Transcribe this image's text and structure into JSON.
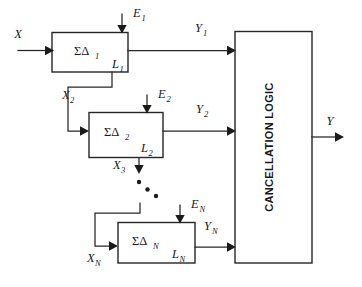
{
  "figure": {
    "type": "block-diagram",
    "background_color": "#ffffff",
    "line_color": "#262626"
  },
  "inputs": {
    "primary": {
      "label": "X",
      "subscript": ""
    }
  },
  "outputs": {
    "final": {
      "label": "Y",
      "subscript": ""
    }
  },
  "stages": [
    {
      "id": "stage-1",
      "block_label": "ΣΔ",
      "block_subscript": "1",
      "loss_label": "L",
      "loss_subscript": "1",
      "error_input_label": "E",
      "error_input_subscript": "1",
      "stage_output_label": "Y",
      "stage_output_subscript": "1",
      "feed_forward_label": "X",
      "feed_forward_subscript": "2"
    },
    {
      "id": "stage-2",
      "block_label": "ΣΔ",
      "block_subscript": "2",
      "loss_label": "L",
      "loss_subscript": "2",
      "error_input_label": "E",
      "error_input_subscript": "2",
      "stage_output_label": "Y",
      "stage_output_subscript": "2",
      "feed_forward_label": "X",
      "feed_forward_subscript": "3"
    },
    {
      "id": "stage-n",
      "block_label": "ΣΔ",
      "block_subscript": "N",
      "loss_label": "L",
      "loss_subscript": "N",
      "error_input_label": "E",
      "error_input_subscript": "N",
      "stage_output_label": "Y",
      "stage_output_subscript": "N",
      "feed_forward_label": "X",
      "feed_forward_subscript": "N"
    }
  ],
  "cancellation_block": {
    "label": "CANCELLATION LOGIC",
    "orientation": "vertical-bottom-to-top"
  },
  "ellipsis": {
    "style": "three-diagonal-dots",
    "count": 3
  }
}
